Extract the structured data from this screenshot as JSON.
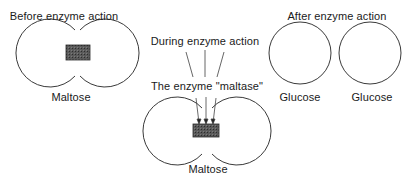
{
  "panels": {
    "before": {
      "title": "Before enzyme action",
      "molecule_label": "Maltose"
    },
    "during": {
      "title": "During enzyme action",
      "enzyme_label": "The enzyme \"maltase\"",
      "molecule_label": "Maltose"
    },
    "after": {
      "title": "After enzyme action",
      "molecule_labels": [
        "Glucose",
        "Glucose"
      ]
    }
  },
  "colors": {
    "outline": "#3a3a3a",
    "bond_fill": "#555555",
    "text": "#1a1a1a"
  }
}
